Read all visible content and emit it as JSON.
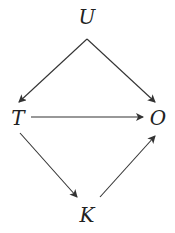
{
  "diagram": {
    "type": "causal-dag",
    "nodes": [
      {
        "id": "U",
        "label": "U",
        "x": 87,
        "y": 16
      },
      {
        "id": "T",
        "label": "T",
        "x": 18,
        "y": 117
      },
      {
        "id": "O",
        "label": "O",
        "x": 158,
        "y": 117
      },
      {
        "id": "K",
        "label": "K",
        "x": 87,
        "y": 215
      }
    ],
    "edges": [
      {
        "from": "U",
        "to": "T"
      },
      {
        "from": "U",
        "to": "O"
      },
      {
        "from": "T",
        "to": "O"
      },
      {
        "from": "T",
        "to": "K"
      },
      {
        "from": "K",
        "to": "O"
      }
    ],
    "edge_color": "#333333"
  }
}
